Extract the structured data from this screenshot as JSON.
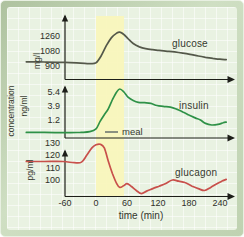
{
  "chart_data": {
    "type": "line",
    "xlabel": "time (min)",
    "ylabel": "concentration",
    "x_ticks": [
      -60,
      0,
      60,
      120,
      180,
      240
    ],
    "x_range": [
      -135,
      255
    ],
    "grid": true,
    "annotations": {
      "meal_label": "meal",
      "meal_band_x": [
        0,
        54
      ],
      "meal_band_color": "#f9f6bc"
    },
    "panels": [
      {
        "name": "glucose",
        "label": "glucose",
        "unit": "mg/l",
        "color": "#54584a",
        "y_ticks": [
          900,
          1080,
          1260
        ],
        "points": [
          [
            -135,
            950
          ],
          [
            -100,
            947
          ],
          [
            -60,
            942
          ],
          [
            -30,
            934
          ],
          [
            -12,
            928
          ],
          [
            0,
            938
          ],
          [
            10,
            1020
          ],
          [
            20,
            1140
          ],
          [
            30,
            1235
          ],
          [
            40,
            1288
          ],
          [
            46,
            1300
          ],
          [
            54,
            1272
          ],
          [
            62,
            1222
          ],
          [
            72,
            1165
          ],
          [
            84,
            1126
          ],
          [
            96,
            1105
          ],
          [
            110,
            1092
          ],
          [
            122,
            1084
          ],
          [
            138,
            1074
          ],
          [
            152,
            1066
          ],
          [
            168,
            1052
          ],
          [
            182,
            1038
          ],
          [
            198,
            1018
          ],
          [
            212,
            1002
          ],
          [
            226,
            990
          ],
          [
            240,
            980
          ],
          [
            252,
            974
          ]
        ]
      },
      {
        "name": "insulin",
        "label": "insulin",
        "unit": "ng/ml",
        "color": "#2e9147",
        "y_ticks": [
          1.2,
          3.9,
          5.4
        ],
        "points": [
          [
            -135,
            0.3
          ],
          [
            -100,
            0.3
          ],
          [
            -60,
            0.28
          ],
          [
            -30,
            0.3
          ],
          [
            -12,
            0.35
          ],
          [
            0,
            0.55
          ],
          [
            8,
            1.1
          ],
          [
            16,
            2.2
          ],
          [
            24,
            3.4
          ],
          [
            32,
            4.6
          ],
          [
            40,
            5.4
          ],
          [
            46,
            5.72
          ],
          [
            54,
            5.4
          ],
          [
            62,
            4.85
          ],
          [
            72,
            4.5
          ],
          [
            82,
            4.3
          ],
          [
            94,
            4.25
          ],
          [
            106,
            4.18
          ],
          [
            118,
            3.95
          ],
          [
            130,
            3.82
          ],
          [
            144,
            3.66
          ],
          [
            156,
            3.3
          ],
          [
            168,
            2.75
          ],
          [
            180,
            2.15
          ],
          [
            192,
            1.6
          ],
          [
            202,
            1.2
          ],
          [
            212,
            0.95
          ],
          [
            224,
            0.84
          ],
          [
            236,
            0.88
          ],
          [
            246,
            1.0
          ],
          [
            252,
            1.05
          ]
        ]
      },
      {
        "name": "glucagon",
        "label": "glucagon",
        "unit": "pg/ml",
        "color": "#c8504b",
        "y_ticks": [
          100,
          110,
          120,
          130
        ],
        "points": [
          [
            -135,
            115
          ],
          [
            -100,
            115
          ],
          [
            -64,
            115
          ],
          [
            -42,
            114
          ],
          [
            -28,
            114.5
          ],
          [
            -18,
            120
          ],
          [
            -8,
            126
          ],
          [
            0,
            128.5
          ],
          [
            8,
            129
          ],
          [
            16,
            126
          ],
          [
            24,
            115
          ],
          [
            32,
            105
          ],
          [
            40,
            97
          ],
          [
            46,
            94
          ],
          [
            54,
            95.5
          ],
          [
            60,
            97
          ],
          [
            68,
            95
          ],
          [
            78,
            91.5
          ],
          [
            88,
            89
          ],
          [
            98,
            91
          ],
          [
            110,
            93
          ],
          [
            122,
            95
          ],
          [
            134,
            97
          ],
          [
            148,
            100
          ],
          [
            160,
            99
          ],
          [
            172,
            98
          ],
          [
            186,
            95
          ],
          [
            198,
            93
          ],
          [
            210,
            91.5
          ],
          [
            222,
            94
          ],
          [
            234,
            97
          ],
          [
            246,
            99.5
          ],
          [
            252,
            100.5
          ]
        ]
      }
    ]
  }
}
